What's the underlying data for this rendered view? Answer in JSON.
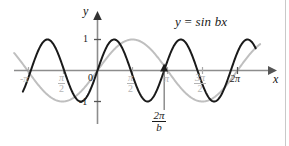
{
  "figure": {
    "background": "#ffffff",
    "border_color": "#c9c9c9"
  },
  "axes": {
    "x_axis_label": "x",
    "y_axis_label": "y",
    "origin_label": "0",
    "y_ticks": [
      {
        "label": "1",
        "value": 1
      },
      {
        "label": "-1",
        "value": -1
      }
    ],
    "x_ticks": [
      {
        "label_top": "-π",
        "label_bottom": "",
        "value": -3.14159,
        "display": "-π",
        "color": "#b4b4b4",
        "fraction": false
      },
      {
        "label_top": "π",
        "label_bottom": "2",
        "value": -1.5708,
        "display": "π/2",
        "color": "#b4b4b4",
        "fraction": true
      },
      {
        "label_top": "π",
        "label_bottom": "2",
        "value": 1.5708,
        "display": "π/2",
        "color": "#b4b4b4",
        "fraction": true
      },
      {
        "label_top": "π",
        "label_bottom": "",
        "value": 3.14159,
        "display": "π",
        "color": "#b4b4b4",
        "fraction": false
      },
      {
        "label_top": "3π",
        "label_bottom": "2",
        "value": 4.71239,
        "display": "3π/2",
        "color": "#b4b4b4",
        "fraction": true
      },
      {
        "label_top": "2π",
        "label_bottom": "",
        "value": 6.28319,
        "display": "2π",
        "color": "#1a1a1a",
        "fraction": false
      }
    ]
  },
  "annotations": {
    "equation": {
      "lhs": "y",
      "operator": "=",
      "rhs": "sin bx",
      "full": "y = sin bx",
      "color": "#1a1a1a"
    },
    "period_marker": {
      "numerator": "2π",
      "denominator": "b",
      "full": "2π/b",
      "color": "#1a1a1a",
      "has_pointer_line": true,
      "has_arrow_marker": true
    }
  },
  "chart_data": {
    "type": "line",
    "title": "y = sin bx",
    "xlabel": "x",
    "ylabel": "y",
    "xlim": [
      -3.74159,
      7.3
    ],
    "ylim": [
      -1.45,
      1.45
    ],
    "grid": false,
    "legend": "none",
    "x_tick_values": [
      -3.14159,
      -1.5708,
      1.5708,
      3.14159,
      4.71239,
      6.28319
    ],
    "x_tick_labels": [
      "-π",
      "π/2",
      "π/2",
      "π",
      "3π/2",
      "2π"
    ],
    "y_tick_values": [
      1,
      -1
    ],
    "y_tick_labels": [
      "1",
      "-1"
    ],
    "series": [
      {
        "name": "y = sin bx",
        "color": "#1a1a1a",
        "linewidth": 2,
        "formula": "sin(b*x)",
        "b": 2.1,
        "amplitude": 1,
        "period": 2.9912,
        "period_expression": "2π/b",
        "x_range": [
          -3.35,
          7.1
        ],
        "description": "Dark compressed sine with period 2π/b, shorter than 2π"
      },
      {
        "name": "y = sin x",
        "color": "#bfbfbf",
        "linewidth": 2,
        "formula": "sin(x)",
        "b": 1,
        "amplitude": 1,
        "period": 6.28319,
        "period_expression": "2π",
        "x_range": [
          -3.74,
          7.3
        ],
        "description": "Light gray reference sine with period 2π"
      }
    ],
    "markers": [
      {
        "label": "2π/b",
        "x": 2.9912,
        "y": 0,
        "type": "triangle-up",
        "color": "#1a1a1a"
      }
    ]
  }
}
